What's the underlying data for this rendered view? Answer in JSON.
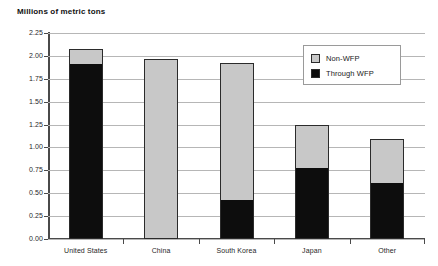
{
  "chart_data": {
    "type": "bar",
    "subtype": "stacked-vertical",
    "title": "Millions of metric tons",
    "xlabel": "",
    "ylabel": "Millions of metric tons",
    "categories": [
      "United States",
      "China",
      "South Korea",
      "Japan",
      "Other"
    ],
    "series": [
      {
        "name": "Through WFP",
        "color": "#0d0d0d",
        "values": [
          1.9,
          0.0,
          0.41,
          0.76,
          0.6
        ]
      },
      {
        "name": "Non-WFP",
        "color": "#c8c8c8",
        "values": [
          0.18,
          1.97,
          1.51,
          0.49,
          0.49
        ]
      }
    ],
    "totals": [
      2.08,
      1.97,
      1.92,
      1.25,
      1.09
    ],
    "ylim": [
      0.0,
      2.25
    ],
    "ytick_step": 0.25,
    "ytick_labels": [
      "0.00",
      "0.25",
      "0.50",
      "0.75",
      "1.00",
      "1.25",
      "1.50",
      "1.75",
      "2.00",
      "2.25"
    ],
    "ytick_values": [
      0.0,
      0.25,
      0.5,
      0.75,
      1.0,
      1.25,
      1.5,
      1.75,
      2.0,
      2.25
    ],
    "grid": true,
    "grid_axis": "y",
    "legend_position": "top-right",
    "legend_entries": [
      "Non-WFP",
      "Through WFP"
    ]
  },
  "legend": {
    "nonwfp_label": "Non-WFP",
    "wfp_label": "Through WFP"
  },
  "colors": {
    "nonwfp": "#c8c8c8",
    "wfp": "#0d0d0d",
    "grid": "#b6b6b6",
    "axis": "#4a4a4a",
    "background": "#ffffff"
  }
}
